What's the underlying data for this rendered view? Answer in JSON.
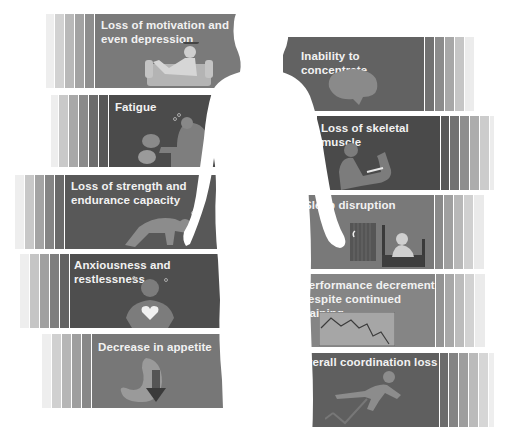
{
  "figure": {
    "left_panels": [
      {
        "label": "Loss of motivation and even depression",
        "line1": "Loss of motivation and",
        "line2": "even depression",
        "illustration": "person-slumped-on-couch",
        "color": "#7a7a7a"
      },
      {
        "label": "Fatigue",
        "line1": "Fatigue",
        "line2": "",
        "illustration": "tired-person-with-dumbbells",
        "color": "#4b4b4b"
      },
      {
        "label": "Loss of strength and endurance capacity",
        "line1": "Loss of strength and",
        "line2": "endurance capacity",
        "illustration": "person-collapsed-on-floor",
        "color": "#585858"
      },
      {
        "label": "Anxiousness and restlessness",
        "line1": "Anxiousness and restlessness",
        "line2": "",
        "illustration": "person-with-glowing-heart",
        "color": "#4e4e4e"
      },
      {
        "label": "Decrease in appetite",
        "line1": "Decrease in appetite",
        "line2": "",
        "illustration": "stomach-with-down-arrow",
        "color": "#777777"
      }
    ],
    "right_panels": [
      {
        "label": "Inability to concentrate",
        "line1": "Inability to concentrate",
        "line2": "",
        "illustration": "brain",
        "color": "#626262"
      },
      {
        "label": "Loss of skeletal muscle",
        "line1": "Loss of skeletal muscle",
        "line2": "",
        "illustration": "flexing-arm",
        "color": "#4a4a4a"
      },
      {
        "label": "Sleep disruption",
        "line1": "Sleep disruption",
        "line2": "",
        "illustration": "person-awake-in-bed-by-window",
        "color": "#797979"
      },
      {
        "label": "Performance decrement despite continued training",
        "line1": "Performance decrement",
        "line2": "despite continued training",
        "illustration": "declining-line-graph",
        "color": "#858585"
      },
      {
        "label": "Overall coordination loss",
        "line1": "Overall coordination loss",
        "line2": "",
        "illustration": "person-tripping-over-hurdle",
        "color": "#5f5f5f"
      }
    ],
    "center": {
      "illustration": "human-body-silhouette"
    }
  }
}
